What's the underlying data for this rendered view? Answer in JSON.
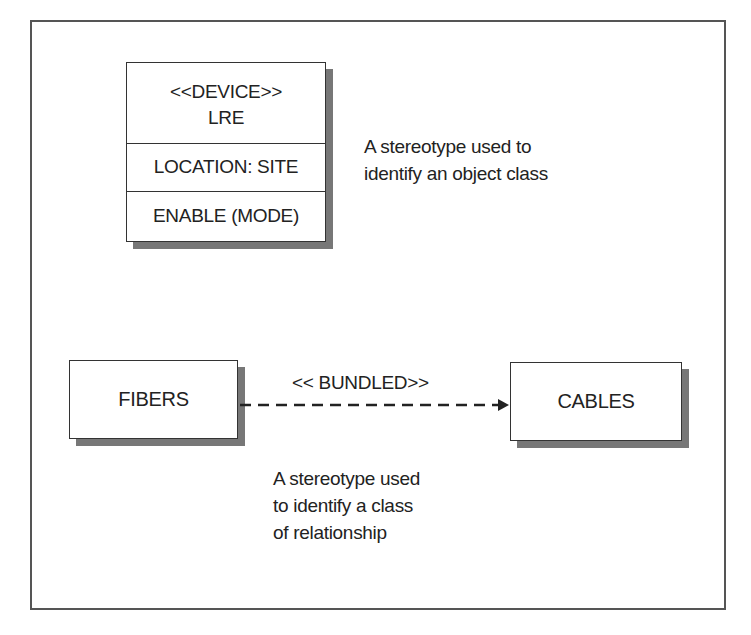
{
  "class_box": {
    "stereotype": "<<DEVICE>>",
    "name": "LRE",
    "attribute": "LOCATION: SITE",
    "operation": "ENABLE (MODE)"
  },
  "class_note": {
    "line1": "A stereotype used to",
    "line2": "identify an object class"
  },
  "relationship": {
    "source": "FIBERS",
    "target": "CABLES",
    "label": "<< BUNDLED>>",
    "line_style": "dashed",
    "arrow": "open-head"
  },
  "relationship_note": {
    "line1": "A stereotype used",
    "line2": "to identify a class",
    "line3": "of relationship"
  },
  "colors": {
    "border": "#333333",
    "shadow": "#777777",
    "text": "#222222"
  }
}
